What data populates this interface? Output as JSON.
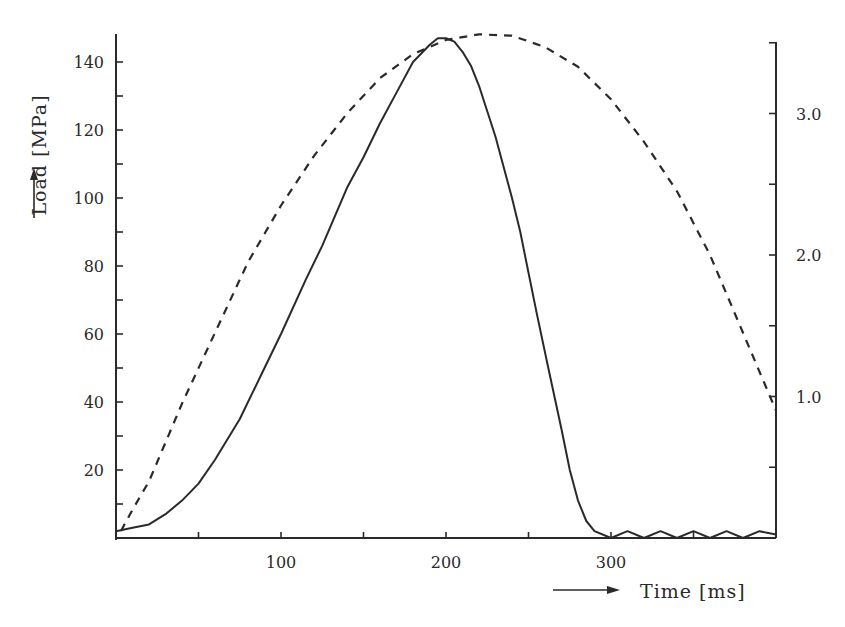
{
  "chart_data": {
    "type": "line",
    "title": "",
    "xlabel": "Time [ms]",
    "ylabel": "Load [MPa]",
    "y2label": "",
    "xlim": [
      0,
      400
    ],
    "ylim": [
      0,
      147
    ],
    "y2lim": [
      0,
      3.6
    ],
    "grid": false,
    "legend": null,
    "x_ticks": [
      100,
      200,
      300
    ],
    "x_minor_ticks": [
      50,
      150,
      250,
      350
    ],
    "y_ticks": [
      20,
      40,
      60,
      80,
      100,
      120,
      140
    ],
    "y_minor_ticks": [
      10,
      30,
      50,
      70,
      90,
      110,
      130
    ],
    "y2_ticks": [
      1.0,
      2.0,
      3.0
    ],
    "y2_minor_ticks": [
      0.5,
      1.5,
      2.5,
      3.5
    ],
    "x_tick_labels": [
      "100",
      "200",
      "300"
    ],
    "y_tick_labels": [
      "20",
      "40",
      "60",
      "80",
      "100",
      "120",
      "140"
    ],
    "y2_tick_labels": [
      "1.0",
      "2.0",
      "3.0"
    ],
    "series": [
      {
        "name": "Load",
        "axis": "left",
        "style": "solid",
        "x": [
          0,
          10,
          20,
          30,
          40,
          50,
          60,
          75,
          90,
          100,
          115,
          125,
          140,
          150,
          160,
          170,
          180,
          190,
          195,
          200,
          205,
          210,
          215,
          220,
          230,
          240,
          245,
          250,
          255,
          262,
          270,
          275,
          280,
          285,
          290,
          300,
          310,
          320,
          330,
          340,
          350,
          360,
          370,
          380,
          390,
          400
        ],
        "values": [
          2,
          3,
          4,
          7,
          11,
          16,
          23,
          35,
          50,
          60,
          76,
          86,
          103,
          112,
          122,
          131,
          140,
          145,
          147,
          147,
          146,
          143,
          139,
          133,
          118,
          100,
          90,
          78,
          66,
          50,
          32,
          20,
          11,
          5,
          2,
          0,
          2,
          0,
          2,
          0,
          2,
          0,
          2,
          0,
          2,
          1
        ]
      },
      {
        "name": "Secondary (dashed)",
        "axis": "right",
        "style": "dashed",
        "x": [
          3,
          10,
          20,
          40,
          60,
          80,
          100,
          120,
          140,
          160,
          180,
          200,
          220,
          240,
          260,
          280,
          300,
          320,
          340,
          360,
          380,
          400
        ],
        "values": [
          0.05,
          0.2,
          0.4,
          0.95,
          1.45,
          1.95,
          2.35,
          2.7,
          3.0,
          3.25,
          3.42,
          3.52,
          3.56,
          3.55,
          3.47,
          3.33,
          3.1,
          2.8,
          2.45,
          2.0,
          1.45,
          0.9
        ]
      }
    ]
  }
}
